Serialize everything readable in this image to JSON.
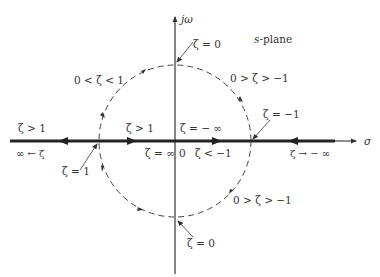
{
  "title": "s-plane",
  "axes": {
    "vertical_label": "jω",
    "horizontal_label": "σ",
    "origin_label": "0"
  },
  "labels": {
    "zeta_eq_0_top": "ζ = 0",
    "zeta_eq_0_bottom": "ζ = 0",
    "underdamped_left": "0 < ζ < 1",
    "negative_damped_top": "0 > ζ > −1",
    "negative_damped_bottom": "0 > ζ > −1",
    "zeta_eq_neg1": "ζ = −1",
    "zeta_eq_1": "ζ = 1",
    "zeta_gt1_left": "ζ > 1",
    "zeta_gt1_inner": "ζ > 1",
    "zeta_to_infinity_left": "∞ ← ζ",
    "zeta_eq_infinity": "ζ = ∞",
    "zeta_eq_neg_infinity": "ζ = − ∞",
    "zeta_lt_neg1": "ζ < −1",
    "zeta_to_neg_infinity": "ζ → − ∞"
  },
  "colors": {
    "ink": "#333333",
    "background": "#ffffff"
  }
}
